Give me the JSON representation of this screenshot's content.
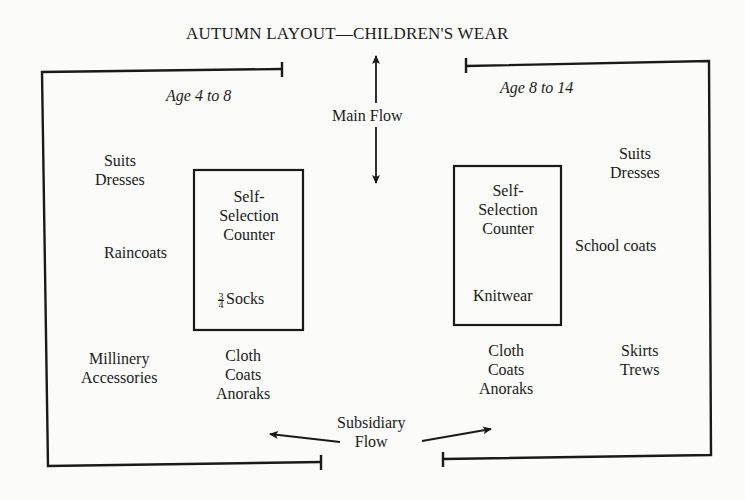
{
  "title": "AUTUMN LAYOUT—CHILDREN'S WEAR",
  "sections": {
    "left": {
      "heading": "Age 4 to 8"
    },
    "right": {
      "heading": "Age 8 to 14"
    }
  },
  "flows": {
    "main": "Main Flow",
    "subsidiary_line1": "Subsidiary",
    "subsidiary_line2": "Flow"
  },
  "left_area": {
    "suits_dresses": [
      "Suits",
      "Dresses"
    ],
    "raincoats": "Raincoats",
    "millinery_accessories": [
      "Millinery",
      "Accessories"
    ],
    "counter": {
      "lines": [
        "Self-",
        "Selection",
        "Counter"
      ],
      "item_fraction_num": "3",
      "item_fraction_den": "4",
      "item": "Socks"
    },
    "cloth_coats": [
      "Cloth",
      "Coats",
      "Anoraks"
    ]
  },
  "right_area": {
    "suits_dresses": [
      "Suits",
      "Dresses"
    ],
    "school_coats": "School coats",
    "skirts_trews": [
      "Skirts",
      "Trews"
    ],
    "counter": {
      "lines": [
        "Self-",
        "Selection",
        "Counter"
      ],
      "item": "Knitwear"
    },
    "cloth_coats": [
      "Cloth",
      "Coats",
      "Anoraks"
    ]
  },
  "colors": {
    "ink": "#1a1a1a",
    "paper": "#fbfbfa"
  }
}
